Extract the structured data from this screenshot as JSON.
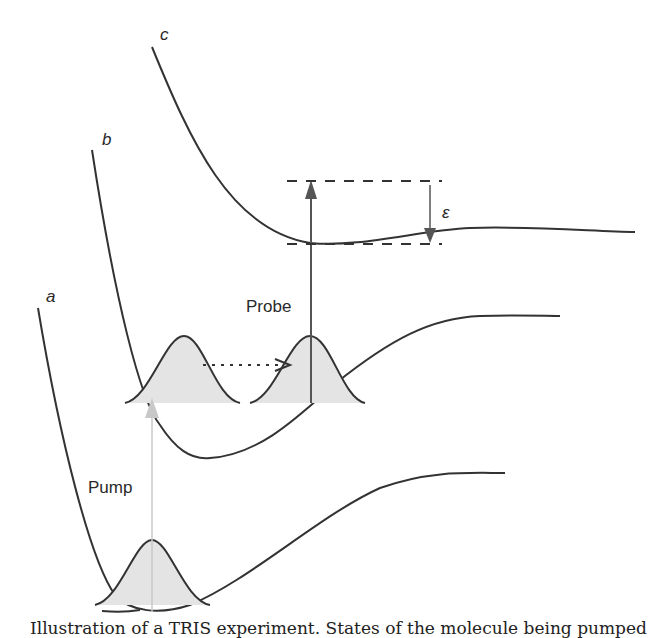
{
  "figure": {
    "type": "potential energy surface diagram",
    "curve_labels": {
      "a": "a",
      "b": "b",
      "c": "c"
    },
    "arrows": {
      "pump": "Pump",
      "probe": "Probe"
    },
    "energy_symbol": "ε",
    "caption_partial": "Illustration of a TRIS experiment. States of the molecule being pumped"
  },
  "colors": {
    "line": "#333333",
    "wavepacket_fill": "#e4e4e4",
    "pump_arrow": "#c8c8c8",
    "probe_arrow": "#555555"
  }
}
